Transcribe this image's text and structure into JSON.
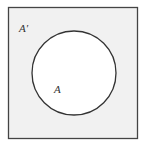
{
  "diagram": {
    "type": "venn",
    "universe": {
      "label": "A′",
      "fill": "#f1f1f1",
      "stroke": "#444444"
    },
    "set": {
      "label": "A",
      "fill": "#ffffff",
      "stroke": "#333333"
    }
  }
}
